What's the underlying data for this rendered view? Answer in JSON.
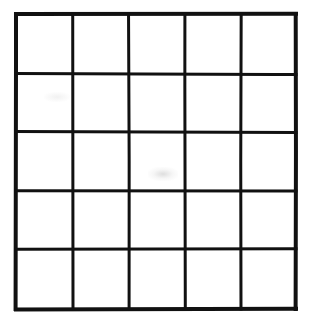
{
  "figure": {
    "type": "grid-drawing",
    "rows": 5,
    "columns": 5,
    "cell_count": 25,
    "line_color": "#111111",
    "cell_fill": "#ffffff",
    "background_color": "#ffffff",
    "style": "hand-drawn scanned line grid, no text or labels",
    "outer_border_width_px": 4,
    "inner_line_width_px": 3,
    "bounds": {
      "left": 16,
      "top": 14,
      "right": 296,
      "bottom": 309,
      "width": 280,
      "height": 295
    },
    "vertical_line_x": [
      16,
      73,
      129,
      185,
      241,
      296
    ],
    "horizontal_line_y": [
      14,
      74,
      132,
      191,
      249,
      309
    ],
    "cells": [
      [
        {
          "row": 1,
          "col": 1,
          "label": ""
        },
        {
          "row": 1,
          "col": 2,
          "label": ""
        },
        {
          "row": 1,
          "col": 3,
          "label": ""
        },
        {
          "row": 1,
          "col": 4,
          "label": ""
        },
        {
          "row": 1,
          "col": 5,
          "label": ""
        }
      ],
      [
        {
          "row": 2,
          "col": 1,
          "label": ""
        },
        {
          "row": 2,
          "col": 2,
          "label": ""
        },
        {
          "row": 2,
          "col": 3,
          "label": ""
        },
        {
          "row": 2,
          "col": 4,
          "label": ""
        },
        {
          "row": 2,
          "col": 5,
          "label": ""
        }
      ],
      [
        {
          "row": 3,
          "col": 1,
          "label": ""
        },
        {
          "row": 3,
          "col": 2,
          "label": ""
        },
        {
          "row": 3,
          "col": 3,
          "label": ""
        },
        {
          "row": 3,
          "col": 4,
          "label": ""
        },
        {
          "row": 3,
          "col": 5,
          "label": ""
        }
      ],
      [
        {
          "row": 4,
          "col": 1,
          "label": ""
        },
        {
          "row": 4,
          "col": 2,
          "label": ""
        },
        {
          "row": 4,
          "col": 3,
          "label": ""
        },
        {
          "row": 4,
          "col": 4,
          "label": ""
        },
        {
          "row": 4,
          "col": 5,
          "label": ""
        }
      ],
      [
        {
          "row": 5,
          "col": 1,
          "label": ""
        },
        {
          "row": 5,
          "col": 2,
          "label": ""
        },
        {
          "row": 5,
          "col": 3,
          "label": ""
        },
        {
          "row": 5,
          "col": 4,
          "label": ""
        },
        {
          "row": 5,
          "col": 5,
          "label": ""
        }
      ]
    ]
  }
}
